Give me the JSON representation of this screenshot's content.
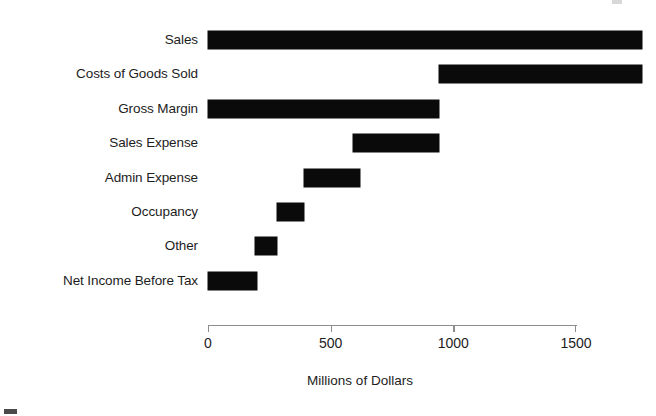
{
  "chart_data": {
    "type": "bar",
    "subtype": "waterfall-horizontal-floating",
    "title": "",
    "xlabel": "Millions of Dollars",
    "ylabel": "",
    "orientation": "horizontal",
    "xlim": [
      0,
      1790
    ],
    "axis_min_label": 0,
    "axis_max_label": 1500,
    "xticks": [
      0,
      500,
      1000,
      1500
    ],
    "xtick_labels": [
      "0",
      "500",
      "1000",
      "1500"
    ],
    "grid": false,
    "legend": false,
    "bar_color": "#0a0a0a",
    "axis_color": "#8d8d8d",
    "categories": [
      "Sales",
      "Costs of Goods Sold",
      "Gross Margin",
      "Sales Expense",
      "Admin Expense",
      "Occupancy",
      "Other",
      "Net Income Before Tax"
    ],
    "values": [
      1770,
      830,
      940,
      350,
      230,
      110,
      90,
      200
    ],
    "bars": [
      {
        "label": "Sales",
        "start": 0,
        "end": 1770,
        "value": 1770
      },
      {
        "label": "Costs of Goods Sold",
        "start": 940,
        "end": 1770,
        "value": 830
      },
      {
        "label": "Gross Margin",
        "start": 0,
        "end": 940,
        "value": 940
      },
      {
        "label": "Sales Expense",
        "start": 590,
        "end": 940,
        "value": 350
      },
      {
        "label": "Admin Expense",
        "start": 390,
        "end": 620,
        "value": 230
      },
      {
        "label": "Occupancy",
        "start": 280,
        "end": 390,
        "value": 110
      },
      {
        "label": "Other",
        "start": 190,
        "end": 280,
        "value": 90
      },
      {
        "label": "Net Income Before Tax",
        "start": 0,
        "end": 200,
        "value": 200
      }
    ]
  },
  "axis": {
    "title": "Millions of Dollars",
    "ticks": [
      "0",
      "500",
      "1000",
      "1500"
    ]
  }
}
